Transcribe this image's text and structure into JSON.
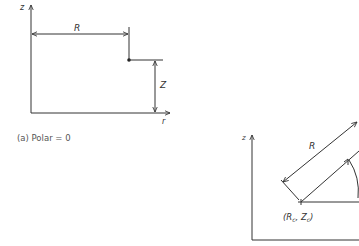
{
  "diagram_a": {
    "axis_z_label": "z",
    "axis_r_label": "r",
    "dim_R_label": "R",
    "dim_Z_label": "Z",
    "caption": "(a) Polar = 0"
  },
  "diagram_b": {
    "axis_z_label": "z",
    "dim_R_label": "R",
    "center_label": "(R",
    "center_sub_r": "c",
    "center_sep": ", Z",
    "center_sub_z": "c",
    "center_close": ")"
  },
  "colors": {
    "line": "#333333",
    "background": "#ffffff"
  }
}
